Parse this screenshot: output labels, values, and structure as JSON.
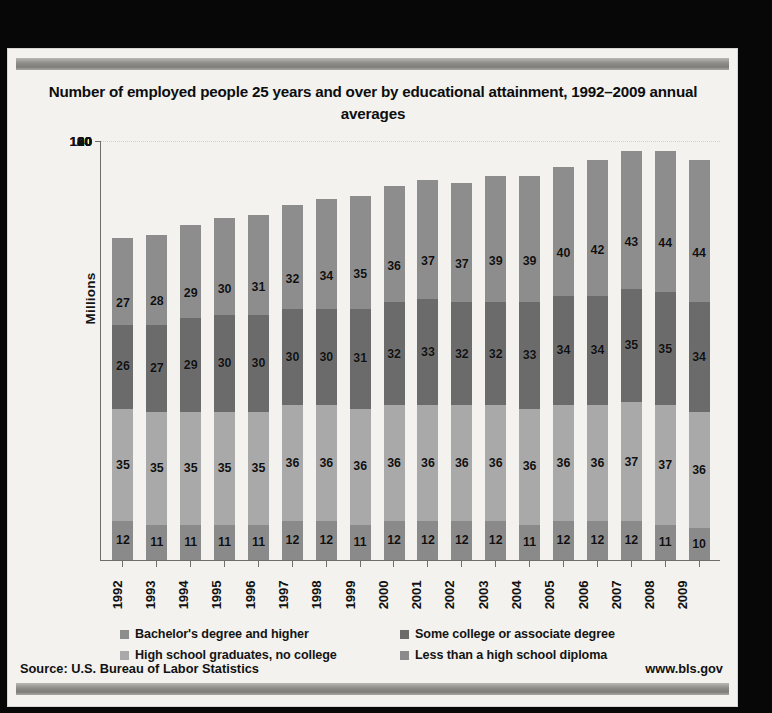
{
  "card": {
    "title": "Number of employed people 25 years and over by educational attainment, 1992–2009 annual averages",
    "source": "Source: U.S. Bureau of Labor Statistics",
    "weblink": "www.bls.gov"
  },
  "legend": [
    {
      "label": "Bachelor's degree and higher",
      "color": "#8d8d8d"
    },
    {
      "label": "Some college or associate  degree",
      "color": "#6b6b6b"
    },
    {
      "label": "High school graduates, no college",
      "color": "#a9a9a9"
    },
    {
      "label": "Less than a high school diploma",
      "color": "#8a8a8a"
    }
  ],
  "chart_data": {
    "type": "bar",
    "stacked": true,
    "title": "Number of employed people 25 years and over by educational attainment, 1992–2009 annual averages",
    "xlabel": "",
    "ylabel": "Millions",
    "ylim": [
      0,
      130
    ],
    "yticks": [
      0,
      20,
      40,
      60,
      80,
      100,
      120
    ],
    "ytick_labels": [
      "0",
      "20",
      "40",
      "60",
      "80",
      "100",
      "120"
    ],
    "grid": true,
    "legend_position": "bottom",
    "categories": [
      "1992",
      "1993",
      "1994",
      "1995",
      "1996",
      "1997",
      "1998",
      "1999",
      "2000",
      "2001",
      "2002",
      "2003",
      "2004",
      "2005",
      "2006",
      "2007",
      "2008",
      "2009"
    ],
    "series": [
      {
        "name": "Less than a high school diploma",
        "color": "#8a8a8a",
        "values": [
          12,
          11,
          11,
          11,
          11,
          12,
          12,
          11,
          12,
          12,
          12,
          12,
          11,
          12,
          12,
          12,
          11,
          10
        ]
      },
      {
        "name": "High school graduates, no college",
        "color": "#a9a9a9",
        "values": [
          35,
          35,
          35,
          35,
          35,
          36,
          36,
          36,
          36,
          36,
          36,
          36,
          36,
          36,
          36,
          37,
          37,
          36
        ]
      },
      {
        "name": "Some college or associate  degree",
        "color": "#6b6b6b",
        "values": [
          26,
          27,
          29,
          30,
          30,
          30,
          30,
          31,
          32,
          33,
          32,
          32,
          33,
          34,
          34,
          35,
          35,
          34
        ]
      },
      {
        "name": "Bachelor's degree and higher",
        "color": "#8d8d8d",
        "values": [
          27,
          28,
          29,
          30,
          31,
          32,
          34,
          35,
          36,
          37,
          37,
          39,
          39,
          40,
          42,
          43,
          44,
          44
        ]
      }
    ],
    "totals": [
      100,
      101,
      104,
      106,
      107,
      110,
      112,
      113,
      116,
      118,
      117,
      119,
      119,
      122,
      124,
      127,
      127,
      124
    ]
  }
}
